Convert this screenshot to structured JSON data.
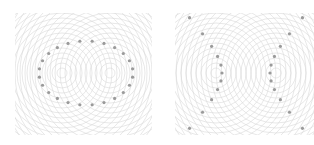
{
  "figure": {
    "panels": [
      {
        "id": "ellipse",
        "clip": {
          "x": 15,
          "y": 13,
          "w": 137,
          "h": 122
        },
        "foci": [
          [
            62,
            73
          ],
          [
            110,
            73
          ]
        ],
        "ring_spacing": 5,
        "ring_count": 24,
        "curve": {
          "type": "ellipse",
          "cx": 86,
          "cy": 73,
          "rx": 47,
          "ry": 32,
          "dots": 24
        }
      },
      {
        "id": "hyperbola",
        "clip": {
          "x": 175,
          "y": 13,
          "w": 139,
          "h": 122
        },
        "foci": [
          [
            216,
            73
          ],
          [
            276,
            73
          ]
        ],
        "ring_spacing": 5,
        "ring_count": 24,
        "curve": {
          "type": "hyperbola",
          "cx": 246,
          "cy": 73,
          "a": 24,
          "dots_per_arm": 7
        }
      }
    ],
    "colors": {
      "ring": "#d9d9d9",
      "dot": "#9a9a9a",
      "background": "#ffffff"
    }
  }
}
